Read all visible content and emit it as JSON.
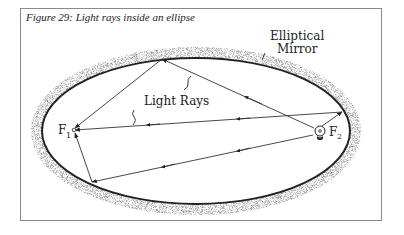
{
  "figure": {
    "caption": "Figure 29: Light rays inside an ellipse",
    "labels": {
      "mirror_line1": "Elliptical",
      "mirror_line2": "Mirror",
      "rays": "Light Rays",
      "focus1": "F",
      "focus1_sub": "1",
      "focus2": "F",
      "focus2_sub": "2"
    },
    "icons": {
      "light_source": "light-bulb-icon"
    },
    "colors": {
      "frame": "#8a8a8a",
      "ink": "#222222",
      "stipple": "#9a9a9a"
    }
  }
}
